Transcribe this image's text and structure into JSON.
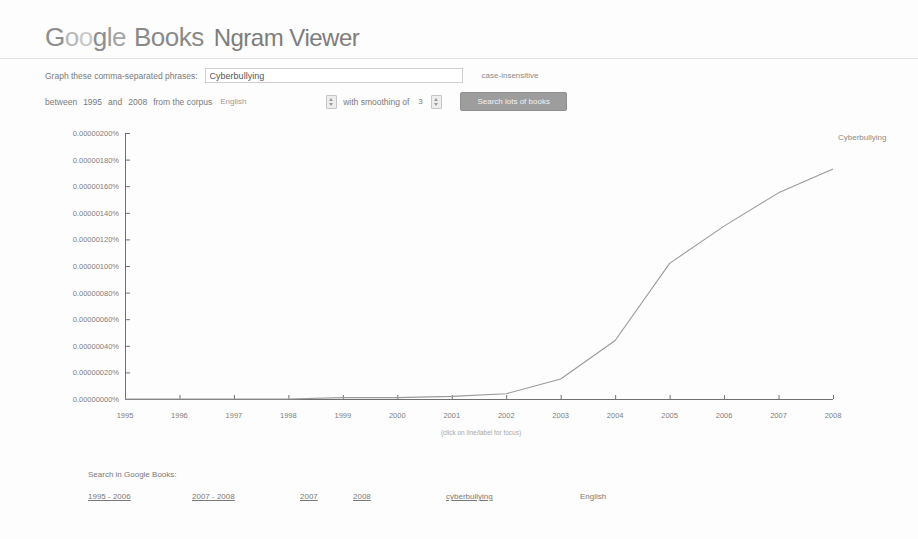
{
  "header": {
    "logo": {
      "google": [
        "G",
        "o",
        "o",
        "g",
        "l",
        "e"
      ],
      "books": "Books",
      "product": "Ngram Viewer"
    }
  },
  "form": {
    "phrase_label": "Graph these comma-separated phrases:",
    "phrase_value": "Cyberbullying",
    "phrase_placeholder": "",
    "case_insensitive_label": "case-insensitive",
    "between_label": "between",
    "year_start": "1995",
    "and_label": "and",
    "year_end": "2008",
    "corpus_label": "from the corpus",
    "corpus_value": "English",
    "smoothing_label": "with smoothing of",
    "smoothing_value": "3",
    "search_button": "Search lots of books"
  },
  "chart_data": {
    "type": "line",
    "title": "",
    "xlabel": "",
    "ylabel": "",
    "x": [
      1995,
      1996,
      1997,
      1998,
      1999,
      2000,
      2001,
      2002,
      2003,
      2004,
      2005,
      2006,
      2007,
      2008
    ],
    "xtick_labels": [
      "1995",
      "1996",
      "1997",
      "1998",
      "1999",
      "2000",
      "2001",
      "2002",
      "2003",
      "2004",
      "2005",
      "2006",
      "2007",
      "2008"
    ],
    "ytick_labels": [
      "0.00000200%",
      "0.00000180%",
      "0.00000160%",
      "0.00000140%",
      "0.00000120%",
      "0.00000100%",
      "0.00000080%",
      "0.00000060%",
      "0.00000040%",
      "0.00000020%",
      "0.00000000%"
    ],
    "ytick_values": [
      2.0,
      1.8,
      1.6,
      1.4,
      1.2,
      1.0,
      0.8,
      0.6,
      0.4,
      0.2,
      0.0
    ],
    "ylim": [
      0.0,
      2.0
    ],
    "xlim": [
      1995,
      2008
    ],
    "yunit": "1e-6 percent",
    "grid": false,
    "legend_position": "line-end-label",
    "series": [
      {
        "name": "Cyberbullying",
        "color": "#9a9a9a",
        "values": [
          0.0,
          0.0,
          0.0,
          0.0,
          0.01,
          0.01,
          0.02,
          0.04,
          0.15,
          0.44,
          1.02,
          1.3,
          1.55,
          1.73
        ]
      }
    ],
    "annotations": [
      "(click on line/label for focus)"
    ]
  },
  "chart_note": "(click on line/label for focus)",
  "footer": {
    "title": "Search in Google Books:",
    "links": [
      {
        "label": "1995 - 2006",
        "underline": true
      },
      {
        "label": "2007 - 2008",
        "underline": true
      },
      {
        "label": "2007",
        "underline": true
      },
      {
        "label": "2008",
        "underline": true
      },
      {
        "label": "cyberbullying",
        "underline": true
      },
      {
        "label": "English",
        "underline": false
      }
    ]
  },
  "colors": {
    "line": "#9a9a9a",
    "axis": "#707070",
    "text": "#7a7a7a",
    "button": "#9d9d9d"
  }
}
